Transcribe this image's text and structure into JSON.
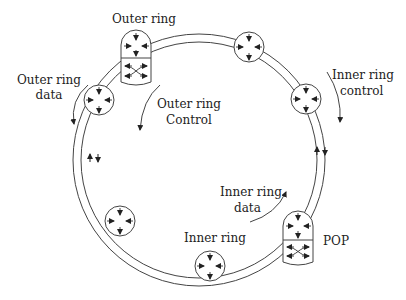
{
  "diagram": {
    "labels": {
      "outer_ring_top": "Outer ring",
      "outer_ring_data_l1": "Outer ring",
      "outer_ring_data_l2": "data",
      "outer_ring_control_l1": "Outer ring",
      "outer_ring_control_l2": "Control",
      "inner_ring_control_l1": "Inner ring",
      "inner_ring_control_l2": "control",
      "inner_ring_data_l1": "Inner ring",
      "inner_ring_data_l2": "data",
      "inner_ring_bottom": "Inner ring",
      "pop": "POP"
    },
    "nodes": [
      {
        "id": "outer-pop",
        "type": "pop"
      },
      {
        "id": "node-top",
        "type": "node"
      },
      {
        "id": "node-upper-right",
        "type": "node"
      },
      {
        "id": "node-left",
        "type": "node"
      },
      {
        "id": "node-lower-left",
        "type": "node"
      },
      {
        "id": "node-bottom",
        "type": "node"
      },
      {
        "id": "inner-pop",
        "type": "pop"
      }
    ],
    "colors": {
      "stroke": "#333333",
      "background": "#ffffff"
    }
  }
}
